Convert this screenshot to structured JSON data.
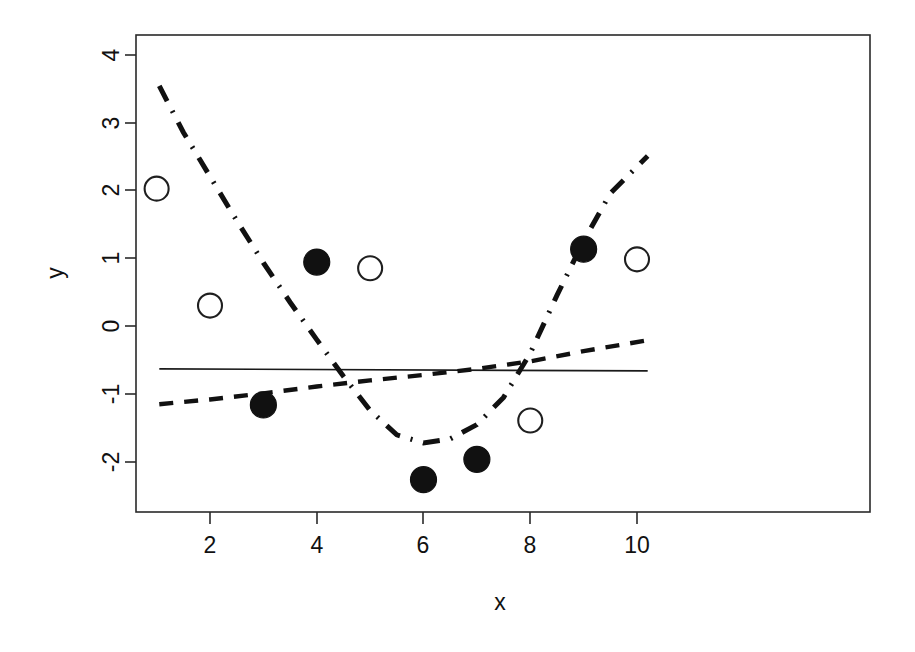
{
  "chart_data": {
    "type": "scatter",
    "title": "",
    "xlabel": "x",
    "ylabel": "y",
    "xlim": [
      0.55,
      10.6
    ],
    "ylim": [
      -2.75,
      4.35
    ],
    "xticks": [
      2,
      4,
      6,
      8,
      10
    ],
    "yticks": [
      -2,
      -1,
      0,
      1,
      2,
      3,
      4
    ],
    "xtick_labels": [
      "2",
      "4",
      "6",
      "8",
      "10"
    ],
    "ytick_labels": [
      "-2",
      "-1",
      "0",
      "1",
      "2",
      "3",
      "4"
    ],
    "grid": false,
    "legend": "none",
    "series": [
      {
        "name": "open-circle-points",
        "marker": "open circle",
        "type": "scatter",
        "x": [
          1,
          2,
          5,
          8,
          10
        ],
        "y": [
          2.02,
          0.3,
          0.85,
          -1.39,
          0.98
        ]
      },
      {
        "name": "filled-circle-points",
        "marker": "filled circle",
        "type": "scatter",
        "x": [
          3,
          4,
          6,
          7,
          9
        ],
        "y": [
          -1.16,
          0.94,
          -2.26,
          -1.96,
          1.13
        ]
      },
      {
        "name": "solid-fit-line",
        "linestyle": "solid",
        "type": "line",
        "x": [
          1.05,
          10.2
        ],
        "y": [
          -0.63,
          -0.66
        ]
      },
      {
        "name": "dashed-fit-line",
        "linestyle": "dashed",
        "type": "line",
        "x": [
          1.05,
          2,
          3,
          4,
          5,
          6,
          7,
          8,
          9,
          10.2
        ],
        "y": [
          -1.15,
          -1.08,
          -0.99,
          -0.89,
          -0.8,
          -0.72,
          -0.63,
          -0.52,
          -0.37,
          -0.21
        ]
      },
      {
        "name": "dashdot-fit-curve",
        "linestyle": "dashdot",
        "type": "line",
        "x": [
          1.05,
          1.5,
          2,
          2.5,
          3,
          3.5,
          4,
          4.5,
          5,
          5.5,
          6,
          6.5,
          7,
          7.5,
          8,
          8.5,
          9,
          9.5,
          10.2
        ],
        "y": [
          3.53,
          2.85,
          2.2,
          1.55,
          0.93,
          0.35,
          -0.2,
          -0.74,
          -1.24,
          -1.6,
          -1.72,
          -1.66,
          -1.45,
          -1.05,
          -0.4,
          0.45,
          1.25,
          1.95,
          2.5
        ]
      }
    ]
  }
}
